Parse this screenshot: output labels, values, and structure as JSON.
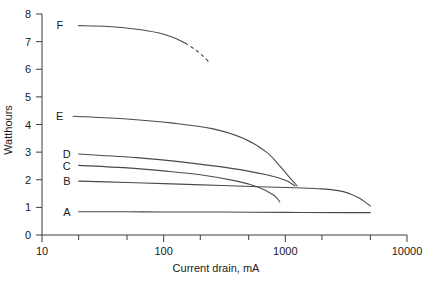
{
  "chart_data": {
    "type": "line",
    "title": "",
    "xlabel": "Current drain, mA",
    "ylabel": "Watthours",
    "xscale": "log",
    "yscale": "linear",
    "xlim": [
      10,
      10000
    ],
    "ylim": [
      0,
      8
    ],
    "xticks": [
      10,
      100,
      1000,
      10000
    ],
    "xtick_labels": [
      "10",
      "100",
      "1000",
      "10000"
    ],
    "yticks": [
      0,
      1,
      2,
      3,
      4,
      5,
      6,
      7,
      8
    ],
    "ytick_labels": [
      "0",
      "1",
      "2",
      "3",
      "4",
      "5",
      "6",
      "7",
      "8"
    ],
    "grid": false,
    "legend": "inline-curve-labels",
    "minor_ticks_x": true,
    "series": [
      {
        "name": "A",
        "label": "A",
        "label_x": 16,
        "label_y": 0.85,
        "linestyle": "solid",
        "points": [
          {
            "x": 20,
            "y": 0.84
          },
          {
            "x": 50,
            "y": 0.84
          },
          {
            "x": 100,
            "y": 0.83
          },
          {
            "x": 300,
            "y": 0.83
          },
          {
            "x": 1000,
            "y": 0.82
          },
          {
            "x": 3000,
            "y": 0.81
          },
          {
            "x": 5000,
            "y": 0.81
          }
        ]
      },
      {
        "name": "B",
        "label": "B",
        "label_x": 16,
        "label_y": 1.95,
        "linestyle": "solid",
        "points": [
          {
            "x": 20,
            "y": 1.95
          },
          {
            "x": 50,
            "y": 1.9
          },
          {
            "x": 100,
            "y": 1.86
          },
          {
            "x": 300,
            "y": 1.79
          },
          {
            "x": 700,
            "y": 1.74
          },
          {
            "x": 1200,
            "y": 1.71
          },
          {
            "x": 2000,
            "y": 1.67
          },
          {
            "x": 3000,
            "y": 1.57
          },
          {
            "x": 4000,
            "y": 1.35
          },
          {
            "x": 5000,
            "y": 1.05
          }
        ]
      },
      {
        "name": "C",
        "label": "C",
        "label_x": 16,
        "label_y": 2.48,
        "linestyle": "solid",
        "points": [
          {
            "x": 20,
            "y": 2.52
          },
          {
            "x": 50,
            "y": 2.43
          },
          {
            "x": 100,
            "y": 2.32
          },
          {
            "x": 200,
            "y": 2.18
          },
          {
            "x": 400,
            "y": 1.95
          },
          {
            "x": 600,
            "y": 1.73
          },
          {
            "x": 800,
            "y": 1.45
          },
          {
            "x": 900,
            "y": 1.2
          }
        ]
      },
      {
        "name": "D",
        "label": "D",
        "label_x": 16,
        "label_y": 2.92,
        "linestyle": "solid",
        "points": [
          {
            "x": 20,
            "y": 2.93
          },
          {
            "x": 60,
            "y": 2.8
          },
          {
            "x": 150,
            "y": 2.63
          },
          {
            "x": 350,
            "y": 2.42
          },
          {
            "x": 700,
            "y": 2.18
          },
          {
            "x": 1000,
            "y": 1.98
          },
          {
            "x": 1200,
            "y": 1.78
          }
        ]
      },
      {
        "name": "E",
        "label": "E",
        "label_x": 14,
        "label_y": 4.3,
        "linestyle": "solid",
        "points": [
          {
            "x": 18,
            "y": 4.3
          },
          {
            "x": 50,
            "y": 4.2
          },
          {
            "x": 120,
            "y": 4.05
          },
          {
            "x": 250,
            "y": 3.85
          },
          {
            "x": 450,
            "y": 3.5
          },
          {
            "x": 700,
            "y": 3.0
          },
          {
            "x": 900,
            "y": 2.5
          },
          {
            "x": 1100,
            "y": 2.05
          },
          {
            "x": 1250,
            "y": 1.78
          }
        ]
      },
      {
        "name": "F",
        "label": "F",
        "label_x": 14,
        "label_y": 7.6,
        "linestyle": "solid-then-dashed",
        "points": [
          {
            "x": 20,
            "y": 7.58
          },
          {
            "x": 35,
            "y": 7.55
          },
          {
            "x": 60,
            "y": 7.45
          },
          {
            "x": 90,
            "y": 7.32
          },
          {
            "x": 120,
            "y": 7.15
          },
          {
            "x": 150,
            "y": 6.95
          }
        ],
        "dashed_points": [
          {
            "x": 150,
            "y": 6.95
          },
          {
            "x": 180,
            "y": 6.72
          },
          {
            "x": 210,
            "y": 6.48
          },
          {
            "x": 240,
            "y": 6.22
          }
        ]
      }
    ]
  }
}
